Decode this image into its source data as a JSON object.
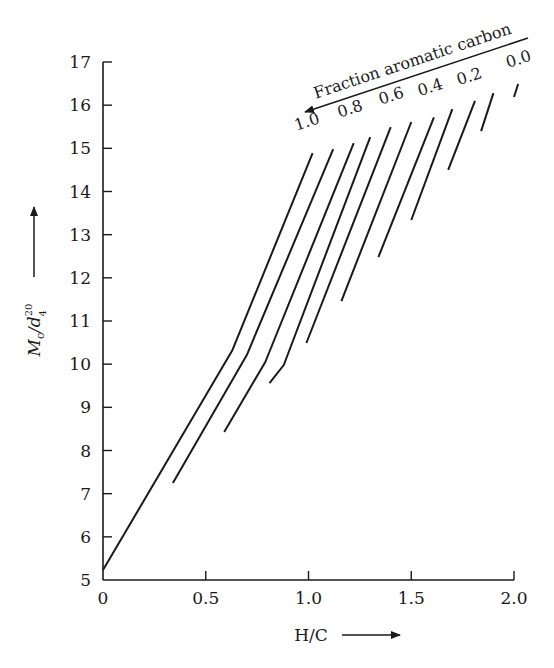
{
  "chart_data": {
    "type": "line",
    "title": "",
    "annotation": "Fraction aromatic carbon",
    "xlabel": "H/C",
    "ylabel": "Mc/d4^20",
    "ylabel_parts": {
      "main": "M",
      "sub_c": "c",
      "slash_d": "/d",
      "sup": "20",
      "sub": "4"
    },
    "xlim": [
      0,
      2.0
    ],
    "ylim": [
      5,
      17
    ],
    "x_ticks": [
      0,
      0.5,
      1.0,
      1.5,
      2.0
    ],
    "x_tick_labels": [
      "0",
      "0.5",
      "1.0",
      "1.5",
      "2.0"
    ],
    "y_ticks": [
      5,
      6,
      7,
      8,
      9,
      10,
      11,
      12,
      13,
      14,
      15,
      16,
      17
    ],
    "y_tick_labels": [
      "5",
      "6",
      "7",
      "8",
      "9",
      "10",
      "11",
      "12",
      "13",
      "14",
      "15",
      "16",
      "17"
    ],
    "grid": false,
    "legend_position": "none",
    "series_labels": [
      {
        "text": "1.0",
        "x": 1.0,
        "y": 15.5
      },
      {
        "text": "0.8",
        "x": 1.21,
        "y": 15.8
      },
      {
        "text": "0.6",
        "x": 1.41,
        "y": 16.1
      },
      {
        "text": "0.4",
        "x": 1.6,
        "y": 16.3
      },
      {
        "text": "0.2",
        "x": 1.79,
        "y": 16.55
      },
      {
        "text": "0.0",
        "x": 2.03,
        "y": 16.95
      }
    ],
    "series": [
      {
        "name": "line-1",
        "points": [
          [
            0.0,
            5.23
          ],
          [
            0.63,
            10.33
          ],
          [
            1.02,
            14.89
          ]
        ]
      },
      {
        "name": "line-2",
        "points": [
          [
            0.34,
            7.25
          ],
          [
            0.7,
            10.21
          ],
          [
            1.12,
            14.98
          ]
        ]
      },
      {
        "name": "line-3",
        "points": [
          [
            0.59,
            8.43
          ],
          [
            0.79,
            10.05
          ],
          [
            1.22,
            15.12
          ]
        ]
      },
      {
        "name": "line-4",
        "points": [
          [
            0.81,
            9.56
          ],
          [
            0.88,
            9.98
          ],
          [
            1.3,
            15.26
          ]
        ]
      },
      {
        "name": "line-5",
        "points": [
          [
            0.99,
            10.49
          ],
          [
            1.4,
            15.49
          ]
        ]
      },
      {
        "name": "line-6",
        "points": [
          [
            1.16,
            11.46
          ],
          [
            1.5,
            15.61
          ]
        ]
      },
      {
        "name": "line-7",
        "points": [
          [
            1.34,
            12.48
          ],
          [
            1.61,
            15.72
          ]
        ]
      },
      {
        "name": "line-8",
        "points": [
          [
            1.5,
            13.34
          ],
          [
            1.7,
            15.91
          ]
        ]
      },
      {
        "name": "line-9",
        "points": [
          [
            1.68,
            14.5
          ],
          [
            1.81,
            16.1
          ]
        ]
      },
      {
        "name": "line-10",
        "points": [
          [
            1.84,
            15.4
          ],
          [
            1.9,
            16.28
          ]
        ]
      },
      {
        "name": "line-11",
        "points": [
          [
            2.0,
            16.19
          ],
          [
            2.02,
            16.49
          ]
        ]
      }
    ]
  },
  "colors": {
    "ink": "#1a1a1a",
    "background": "#ffffff"
  }
}
